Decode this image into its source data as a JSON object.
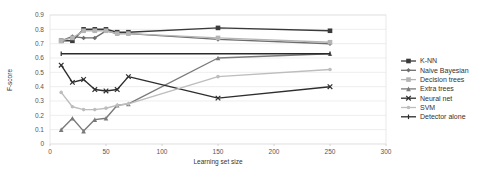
{
  "chart_data": {
    "type": "line",
    "title": "",
    "xlabel": "Learning set size",
    "ylabel": "F-score",
    "xlim": [
      0,
      300
    ],
    "ylim": [
      0,
      0.9
    ],
    "xticks": [
      0,
      50,
      100,
      150,
      200,
      250,
      300
    ],
    "yticks": [
      0,
      0.1,
      0.2,
      0.3,
      0.4,
      0.5,
      0.6,
      0.7,
      0.8,
      0.9
    ],
    "grid": true,
    "legend_position": "right",
    "x": [
      10,
      20,
      30,
      40,
      50,
      60,
      70,
      150,
      250
    ],
    "series": [
      {
        "name": "K-NN",
        "color": "#3a3a3a",
        "marker": "square",
        "values": [
          0.72,
          0.72,
          0.8,
          0.8,
          0.8,
          0.78,
          0.78,
          0.81,
          0.79
        ]
      },
      {
        "name": "Naive Bayesian",
        "color": "#6e6e6e",
        "marker": "diamond",
        "values": [
          0.72,
          0.75,
          0.74,
          0.74,
          0.79,
          0.77,
          0.77,
          0.73,
          0.7
        ]
      },
      {
        "name": "Decision trees",
        "color": "#b5b5b5",
        "marker": "square",
        "values": [
          0.72,
          0.74,
          0.79,
          0.79,
          0.79,
          0.77,
          0.77,
          0.74,
          0.71
        ]
      },
      {
        "name": "Extra trees",
        "color": "#7a7a7a",
        "marker": "triangle",
        "values": [
          0.1,
          0.18,
          0.09,
          0.17,
          0.18,
          0.27,
          0.28,
          0.6,
          0.63
        ]
      },
      {
        "name": "Neural net",
        "color": "#2e2e2e",
        "marker": "x",
        "values": [
          0.55,
          0.43,
          0.45,
          0.38,
          0.37,
          0.38,
          0.47,
          0.32,
          0.4
        ]
      },
      {
        "name": "SVM",
        "color": "#bdbdbd",
        "marker": "star",
        "values": [
          0.36,
          0.26,
          0.24,
          0.24,
          0.25,
          0.27,
          0.28,
          0.47,
          0.52
        ]
      },
      {
        "name": "Detector alone",
        "color": "#2a2a2a",
        "marker": "plus",
        "values": [
          0.63,
          0.63,
          0.63,
          0.63,
          0.63,
          0.63,
          0.63,
          0.63,
          0.63
        ]
      }
    ]
  }
}
